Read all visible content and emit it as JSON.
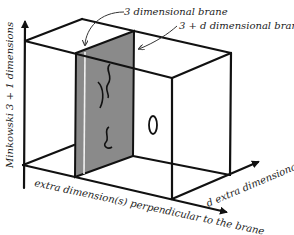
{
  "diagram": {
    "labels": {
      "three_dim_brane": "3 dimensional brane",
      "three_plus_d_brane": "3 + d dimensional brane",
      "minkowski_axis": "Minkowski 3 + 1 dimensions",
      "perpendicular_axis": "extra dimension(s) perpendicular to the brane",
      "d_extra_axis": "d extra dimensional"
    },
    "colors": {
      "brane_fill": "#8a8a8a",
      "lines": "#111111",
      "background": "#ffffff",
      "brane_highlight": "#f0f0f0"
    },
    "symbols": {
      "open_string_marks": 3,
      "closed_string_loop": "0"
    }
  }
}
